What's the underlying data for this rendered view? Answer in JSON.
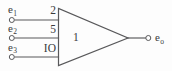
{
  "diagram": {
    "type": "schematic",
    "stroke_color": "#58585a",
    "background_color": "#fdfdfd",
    "gate": {
      "label": "1",
      "shape": "triangle-amplifier"
    },
    "inputs": [
      {
        "signal": "e",
        "subscript": "1",
        "pin": "2"
      },
      {
        "signal": "e",
        "subscript": "2",
        "pin": "5"
      },
      {
        "signal": "e",
        "subscript": "3",
        "pin": "IO"
      }
    ],
    "output": {
      "signal": "e",
      "subscript": "o"
    }
  }
}
